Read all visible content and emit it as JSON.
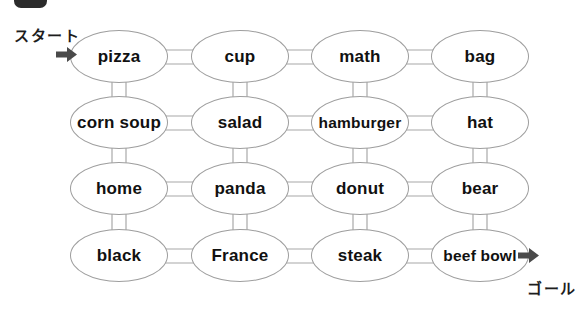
{
  "labels": {
    "start": "スタート",
    "goal": "ゴール"
  },
  "grid": {
    "type": "word-maze-grid",
    "rows": 4,
    "cols": 4,
    "connector_style": "double-line, all adjacent nodes connected",
    "cells": [
      [
        "pizza",
        "cup",
        "math",
        "bag"
      ],
      [
        "corn soup",
        "salad",
        "hamburger",
        "hat"
      ],
      [
        "home",
        "panda",
        "donut",
        "bear"
      ],
      [
        "black",
        "France",
        "steak",
        "beef bowl"
      ]
    ]
  },
  "icons": {
    "start_arrow": "right-arrow",
    "goal_arrow": "right-arrow",
    "top_badge": "clipped-number-badge"
  },
  "colors": {
    "ellipse_border": "#9e9e9e",
    "connector": "#a8a8a8",
    "arrow": "#4a4a4a",
    "badge": "#2b2b2b",
    "text": "#111111"
  }
}
